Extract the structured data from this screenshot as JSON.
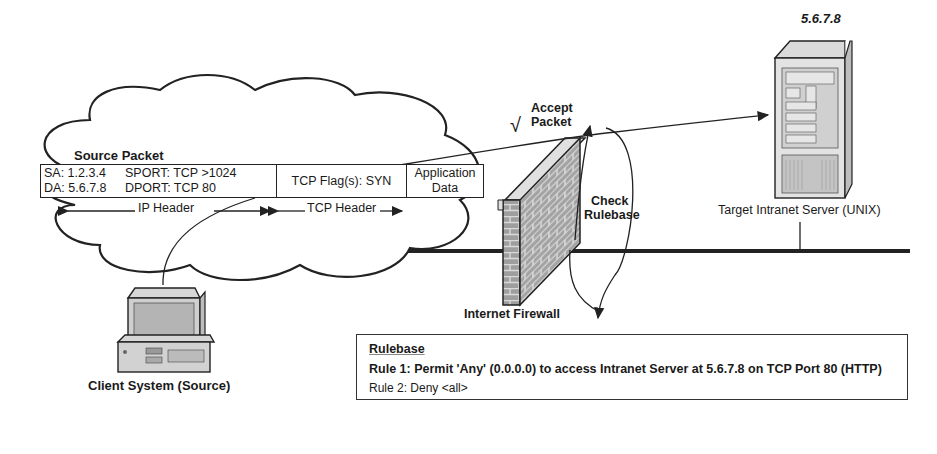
{
  "packet": {
    "title": "Source Packet",
    "ip_header": {
      "sa": "SA: 1.2.3.4",
      "da": "DA: 5.6.7.8",
      "sport": "SPORT: TCP >1024",
      "dport": "DPORT: TCP 80"
    },
    "tcp_flags": "TCP Flag(s): SYN",
    "app_data_line1": "Application",
    "app_data_line2": "Data",
    "ip_header_label": "IP Header",
    "tcp_header_label": "TCP Header"
  },
  "client": {
    "label": "Client System (Source)"
  },
  "firewall": {
    "label": "Internet Firewall",
    "accept_check": "√",
    "accept_line1": "Accept",
    "accept_line2": "Packet",
    "check_line1": "Check",
    "check_line2": "Rulebase"
  },
  "server": {
    "ip": "5.6.7.8",
    "label": "Target Intranet Server (UNIX)"
  },
  "rulebase": {
    "title": "Rulebase",
    "rules": [
      "Rule 1: Permit 'Any' (0.0.0.0) to access Intranet Server at 5.6.7.8 on TCP Port 80 (HTTP)",
      "Rule 2: Deny <all>"
    ]
  }
}
